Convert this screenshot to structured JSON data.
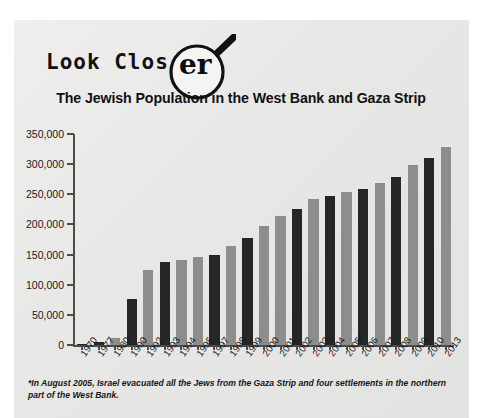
{
  "logo": {
    "text_main": "Look Clos",
    "text_lens": "er",
    "icon": "magnifying-glass-icon"
  },
  "chart_data": {
    "type": "bar",
    "title": "The Jewish Population in the West Bank and Gaza Strip",
    "xlabel": "",
    "ylabel": "",
    "ylim": [
      0,
      350000
    ],
    "yticks": [
      "0",
      "50,000",
      "100,000",
      "150,000",
      "200,000",
      "250,000",
      "300,000",
      "350,000"
    ],
    "ytick_values": [
      0,
      50000,
      100000,
      150000,
      200000,
      250000,
      300000,
      350000
    ],
    "grid": false,
    "legend": "none",
    "colors": {
      "dark_bar": "#262626",
      "light_bar": "#8d8d8b",
      "axis": "#4c4c4c",
      "panel": "#e7e7e5"
    },
    "categories": [
      "1970",
      "1977",
      "1980",
      "1990",
      "1992",
      "1993",
      "1994",
      "1995",
      "1997",
      "1998",
      "1999",
      "2000",
      "2001",
      "2002",
      "2003",
      "2004",
      "2005*",
      "2006",
      "2007",
      "2008",
      "2009",
      "2010",
      "2013"
    ],
    "values": [
      1000,
      5000,
      12000,
      76000,
      124000,
      137000,
      141000,
      146000,
      149000,
      164000,
      178000,
      198000,
      214000,
      226000,
      243000,
      247000,
      253000,
      258000,
      268000,
      278000,
      298000,
      311000,
      328000
    ],
    "bar_styles": [
      "dark",
      "dark",
      "light",
      "dark",
      "light",
      "dark",
      "light",
      "light",
      "dark",
      "light",
      "dark",
      "light",
      "light",
      "dark",
      "light",
      "dark",
      "light",
      "dark",
      "light",
      "dark",
      "light",
      "dark",
      "light"
    ],
    "annotations": [
      "*In August 2005, Israel evacuated all the Jews from the Gaza Strip and four settlements in the northern part of the West Bank."
    ]
  },
  "footnote": "*In August 2005, Israel evacuated all the Jews from the Gaza Strip and four settlements in the northern part of the West Bank."
}
